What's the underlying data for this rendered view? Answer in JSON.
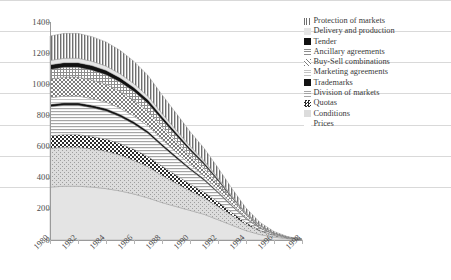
{
  "chart_data": {
    "type": "area",
    "title": "",
    "subtitle": "",
    "xlabel": "",
    "ylabel": "",
    "stacked": true,
    "grid": true,
    "legend_position": "right",
    "xlim": [
      1980,
      1998
    ],
    "ylim": [
      0,
      1400
    ],
    "ytick_values": [
      0,
      200,
      400,
      600,
      800,
      1000,
      1200,
      1400
    ],
    "ytick_labels": [
      "0",
      "200",
      "400",
      "600",
      "800",
      "1000",
      "1200",
      "1400"
    ],
    "x": [
      1980,
      1981,
      1982,
      1983,
      1984,
      1985,
      1986,
      1987,
      1988,
      1989,
      1990,
      1991,
      1992,
      1993,
      1994,
      1995,
      1996,
      1997,
      1998
    ],
    "xtick_labels": [
      "1980",
      "1982",
      "1984",
      "1986",
      "1988",
      "1990",
      "1992",
      "1994",
      "1996",
      "1998"
    ],
    "xtick_values": [
      1980,
      1982,
      1984,
      1986,
      1988,
      1990,
      1992,
      1994,
      1996,
      1998
    ],
    "series": [
      {
        "name": "Prices",
        "pattern": "solid-light",
        "color": "#e2e2e2",
        "values": [
          340,
          345,
          345,
          340,
          330,
          315,
          295,
          270,
          240,
          215,
          190,
          165,
          130,
          95,
          60,
          35,
          18,
          8,
          2
        ]
      },
      {
        "name": "Conditions",
        "pattern": "speckle",
        "color": "#cfcfcf",
        "values": [
          250,
          250,
          250,
          245,
          240,
          230,
          215,
          200,
          175,
          150,
          125,
          105,
          85,
          62,
          40,
          22,
          10,
          4,
          1
        ]
      },
      {
        "name": "Quotas",
        "pattern": "checker",
        "color": "#555555",
        "values": [
          80,
          82,
          82,
          80,
          78,
          75,
          72,
          66,
          60,
          52,
          45,
          38,
          30,
          20,
          12,
          6,
          3,
          1,
          0
        ]
      },
      {
        "name": "Division of markets",
        "pattern": "horizontal-lines",
        "color": "#bdbdbd",
        "values": [
          185,
          188,
          188,
          185,
          180,
          172,
          162,
          148,
          128,
          110,
          92,
          76,
          58,
          40,
          24,
          13,
          6,
          2,
          1
        ]
      },
      {
        "name": "Trademarks",
        "pattern": "solid-black",
        "color": "#111111",
        "values": [
          16,
          16,
          16,
          16,
          16,
          15,
          15,
          14,
          13,
          12,
          11,
          9,
          7,
          5,
          3,
          2,
          1,
          0,
          0
        ]
      },
      {
        "name": "Marketing agreements",
        "pattern": "fine-light",
        "color": "#d2d2d2",
        "values": [
          42,
          43,
          43,
          42,
          41,
          39,
          37,
          34,
          30,
          26,
          22,
          18,
          14,
          10,
          6,
          3,
          1,
          1,
          0
        ]
      },
      {
        "name": "Buy-Sell combinations",
        "pattern": "diagonal-cross",
        "color": "#8f8f8f",
        "values": [
          120,
          122,
          122,
          120,
          116,
          110,
          103,
          94,
          82,
          70,
          58,
          48,
          37,
          25,
          15,
          8,
          4,
          1,
          0
        ]
      },
      {
        "name": "Ancillary agreements",
        "pattern": "grid-hatch",
        "color": "#a8a8a8",
        "values": [
          62,
          63,
          63,
          62,
          60,
          58,
          54,
          50,
          44,
          38,
          31,
          26,
          20,
          14,
          8,
          4,
          2,
          1,
          0
        ]
      },
      {
        "name": "Tender",
        "pattern": "solid-black",
        "color": "#111111",
        "values": [
          30,
          30,
          30,
          30,
          29,
          28,
          26,
          24,
          21,
          18,
          15,
          13,
          10,
          7,
          4,
          2,
          1,
          0,
          0
        ]
      },
      {
        "name": "Delivery and production",
        "pattern": "pale",
        "color": "#dddddd",
        "values": [
          28,
          28,
          28,
          28,
          27,
          26,
          25,
          23,
          20,
          17,
          14,
          12,
          9,
          6,
          4,
          2,
          1,
          0,
          0
        ]
      },
      {
        "name": "Protection of markets",
        "pattern": "vertical-lines",
        "color": "#777777",
        "values": [
          157,
          160,
          160,
          158,
          155,
          150,
          143,
          133,
          120,
          107,
          93,
          80,
          64,
          46,
          29,
          16,
          8,
          3,
          1
        ]
      }
    ],
    "totals": [
      1310,
      1327,
      1327,
      1306,
      1272,
      1218,
      1147,
      1056,
      933,
      815,
      696,
      590,
      464,
      330,
      205,
      113,
      55,
      21,
      5
    ]
  },
  "legend": {
    "items": [
      {
        "label": "Protection of markets",
        "swatch": "vertical-lines-swatch"
      },
      {
        "label": "Delivery and production",
        "swatch": "pale-swatch"
      },
      {
        "label": "Tender",
        "swatch": "solid-black-swatch"
      },
      {
        "label": "Ancillary agreements",
        "swatch": "grid-hatch-swatch"
      },
      {
        "label": "Buy-Sell combinations",
        "swatch": "diagonal-cross-swatch"
      },
      {
        "label": "Marketing agreements",
        "swatch": "fine-light-swatch"
      },
      {
        "label": "Trademarks",
        "swatch": "solid-black-swatch"
      },
      {
        "label": "Division of markets",
        "swatch": "horizontal-lines-swatch"
      },
      {
        "label": "Quotas",
        "swatch": "checker-swatch"
      },
      {
        "label": "Conditions",
        "swatch": "speckle-swatch"
      },
      {
        "label": "Prices",
        "swatch": "blank-swatch"
      }
    ]
  },
  "axes": {
    "y_labels": [
      "1400",
      "1200",
      "1000",
      "800",
      "600",
      "400",
      "200",
      "0"
    ],
    "x_labels": [
      "1980",
      "1982",
      "1984",
      "1986",
      "1988",
      "1990",
      "1992",
      "1994",
      "1996",
      "1998"
    ]
  },
  "colors": {
    "grid": "#d9d9d9",
    "axis": "#9a9a9a",
    "text": "#3a3a3a"
  }
}
